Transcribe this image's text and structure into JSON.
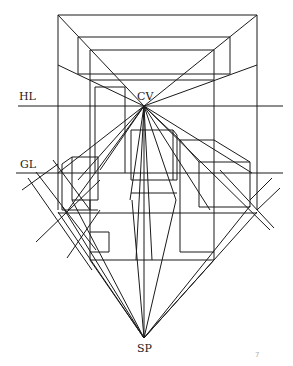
{
  "diagram": {
    "labels": {
      "horizon_line": "HL",
      "center_of_vision": "CV",
      "ground_line": "GL",
      "station_point": "SP",
      "corner_mark": "7"
    },
    "points": {
      "CV": [
        144,
        106
      ],
      "SP": [
        144,
        338
      ]
    },
    "colors": {
      "ink": "#1a1a1a",
      "background": "#ffffff"
    }
  }
}
